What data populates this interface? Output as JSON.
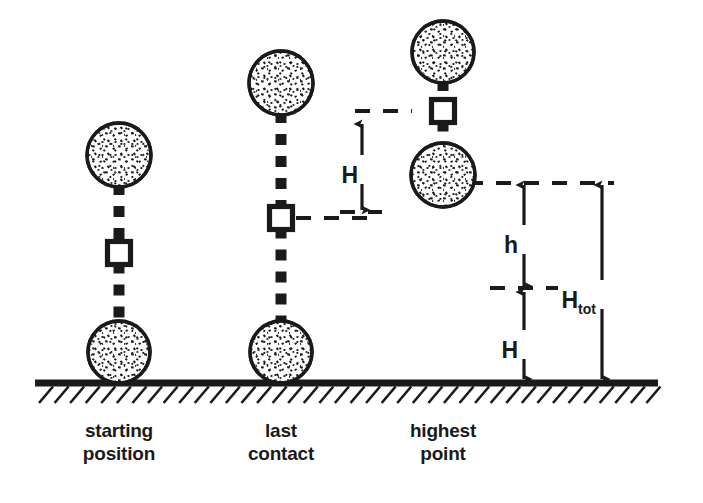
{
  "figure": {
    "background_color": "#ffffff",
    "ink_color": "#1a1a1a"
  },
  "ground": {
    "label": "ground-line",
    "y": 383,
    "x_start": 35,
    "x_end": 658,
    "hatch_count": 40
  },
  "columns": [
    {
      "id": "starting-position",
      "caption_line1": "starting",
      "caption_line2": "position",
      "caption_x": 119,
      "caption_y1": 437,
      "caption_y2": 460,
      "center_x": 119,
      "top_ball": {
        "cx": 119,
        "cy": 155,
        "r": 32
      },
      "bottom_ball": {
        "cx": 119,
        "cy": 352,
        "r": 31
      },
      "com_marker": {
        "cx": 119,
        "cy": 253,
        "size": 23
      }
    },
    {
      "id": "last-contact",
      "caption_line1": "last",
      "caption_line2": "contact",
      "caption_x": 281,
      "caption_y1": 437,
      "caption_y2": 460,
      "center_x": 281,
      "top_ball": {
        "cx": 281,
        "cy": 83,
        "r": 32
      },
      "bottom_ball": {
        "cx": 281,
        "cy": 352,
        "r": 31
      },
      "com_marker": {
        "cx": 281,
        "cy": 218,
        "size": 23
      }
    },
    {
      "id": "highest-point",
      "caption_line1": "highest",
      "caption_line2": "point",
      "caption_x": 443,
      "caption_y1": 437,
      "caption_y2": 460,
      "center_x": 443,
      "top_ball": {
        "cx": 443,
        "cy": 52,
        "r": 31
      },
      "bottom_ball": {
        "cx": 443,
        "cy": 175,
        "r": 32
      },
      "com_marker": {
        "cx": 443,
        "cy": 111,
        "size": 23
      }
    }
  ],
  "dimensions": [
    {
      "id": "H-upper",
      "label": "H",
      "subscript": "",
      "arrow_x": 362,
      "y_top": 122,
      "y_bottom": 212,
      "label_x": 358,
      "label_y": 175,
      "label_anchor": "end",
      "description": "rise of centre of mass from last contact to highest point"
    },
    {
      "id": "h-flight",
      "label": "h",
      "subscript": "",
      "arrow_x": 524,
      "y_top": 183,
      "y_bottom": 288,
      "label_x": 518,
      "label_y": 245,
      "label_anchor": "end",
      "description": "flight height above the last-contact centre of mass level"
    },
    {
      "id": "H-lower",
      "label": "H",
      "subscript": "",
      "arrow_x": 524,
      "y_top": 290,
      "y_bottom": 381,
      "label_x": 518,
      "label_y": 350,
      "label_anchor": "end",
      "description": "height of the centre of mass at last contact above the ground"
    },
    {
      "id": "H-tot",
      "label": "H",
      "subscript": "tot",
      "arrow_x": 602,
      "y_top": 183,
      "y_bottom": 381,
      "label_x": 596,
      "label_y": 300,
      "label_anchor": "end",
      "description": "total height of the centre of mass above the ground at the highest point"
    }
  ],
  "reference_lines": [
    {
      "id": "ref-last-contact-com",
      "x_start": 296,
      "x_end": 372,
      "y": 218
    },
    {
      "id": "ref-highest-com-left",
      "x_start": 355,
      "x_end": 412,
      "y": 111
    },
    {
      "id": "ref-highest-ball-level",
      "x_start": 468,
      "x_end": 614,
      "y": 183
    },
    {
      "id": "ref-last-contact-level",
      "x_start": 340,
      "x_end": 382,
      "y": 212
    },
    {
      "id": "ref-midline-h-H",
      "x_start": 490,
      "x_end": 558,
      "y": 288
    }
  ]
}
